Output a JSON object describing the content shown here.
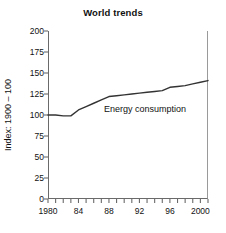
{
  "chart_data": {
    "type": "line",
    "title": "World trends",
    "xlabel": "",
    "ylabel": "Index: 1900 – 100",
    "xlim": [
      1980,
      2001
    ],
    "ylim": [
      0,
      200
    ],
    "grid": false,
    "legend_position": "inline-annotation",
    "y_ticks": [
      200,
      175,
      150,
      125,
      100,
      75,
      50,
      25,
      0
    ],
    "y_tick_labels": [
      "200",
      "175",
      "150",
      "125",
      "100",
      "75",
      "50",
      "25",
      "0"
    ],
    "x_ticks": [
      1980,
      1981,
      1982,
      1983,
      1984,
      1985,
      1986,
      1987,
      1988,
      1989,
      1990,
      1991,
      1992,
      1993,
      1994,
      1995,
      1996,
      1997,
      1998,
      1999,
      2000,
      2001
    ],
    "x_tick_labels": [
      "1980",
      "",
      "",
      "",
      "84",
      "",
      "",
      "",
      "88",
      "",
      "",
      "",
      "92",
      "",
      "",
      "",
      "96",
      "",
      "",
      "",
      "2000",
      ""
    ],
    "x_labeled_ticks": [
      {
        "value": 1980,
        "label": "1980"
      },
      {
        "value": 1984,
        "label": "84"
      },
      {
        "value": 1988,
        "label": "88"
      },
      {
        "value": 1992,
        "label": "92"
      },
      {
        "value": 1996,
        "label": "96"
      },
      {
        "value": 2000,
        "label": "2000"
      }
    ],
    "series": [
      {
        "name": "Energy consumption",
        "annotation_label": "Energy consumption",
        "color": "#333333",
        "x": [
          1980,
          1981,
          1982,
          1983,
          1984,
          1985,
          1986,
          1987,
          1988,
          1989,
          1990,
          1991,
          1992,
          1993,
          1994,
          1995,
          1996,
          1997,
          1998,
          1999,
          2000,
          2001
        ],
        "values": [
          100,
          100,
          99,
          99,
          106,
          110,
          114,
          118,
          122,
          123,
          124,
          125,
          126,
          127,
          128,
          129,
          133,
          134,
          135,
          137,
          139,
          141
        ]
      }
    ]
  },
  "annotations": {
    "series_label": "Energy consumption"
  }
}
